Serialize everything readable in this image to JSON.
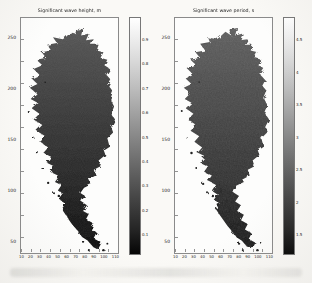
{
  "figure": {
    "kind": "scanned-journal-figure",
    "background": "#faf9f6",
    "panel_count": 2
  },
  "panels": [
    {
      "title": "Significant wave height, m",
      "y_ticks": [
        "250",
        "200",
        "150",
        "100",
        "50"
      ],
      "x_ticks": [
        "10",
        "20",
        "30",
        "40",
        "50",
        "60",
        "70",
        "80",
        "90",
        "100",
        "110"
      ],
      "colorbar": {
        "orientation": "vertical",
        "gradient_top": "#ffffff",
        "gradient_bottom": "#050505",
        "ticks": [
          "0.9",
          "0.8",
          "0.7",
          "0.6",
          "0.5",
          "0.4",
          "0.3",
          "0.2",
          "0.1"
        ]
      },
      "map_fill_top": "#565656",
      "map_fill_bottom": "#0d0d0d"
    },
    {
      "title": "Significant wave period, s",
      "y_ticks": [
        "250",
        "200",
        "150",
        "100",
        "50"
      ],
      "x_ticks": [
        "10",
        "20",
        "30",
        "40",
        "50",
        "60",
        "70",
        "80",
        "90",
        "100",
        "110"
      ],
      "colorbar": {
        "orientation": "vertical",
        "gradient_top": "#ffffff",
        "gradient_bottom": "#050505",
        "ticks": [
          "4.5",
          "4",
          "3.5",
          "3",
          "2.5",
          "2",
          "1.5"
        ]
      },
      "map_fill_top": "#5e5e5e",
      "map_fill_bottom": "#151515"
    }
  ],
  "chart_data": [
    {
      "type": "heatmap",
      "title": "Significant wave height, m",
      "xlabel": "",
      "ylabel": "",
      "x_ticks": [
        10,
        20,
        30,
        40,
        50,
        60,
        70,
        80,
        90,
        100,
        110
      ],
      "y_ticks": [
        50,
        100,
        150,
        200,
        250
      ],
      "xlim": [
        0,
        115
      ],
      "ylim": [
        0,
        260
      ],
      "colorbar_ticks": [
        0.1,
        0.2,
        0.3,
        0.4,
        0.5,
        0.6,
        0.7,
        0.8,
        0.9
      ],
      "colormap": "grayscale (light = high value at top of bar, dark = low)",
      "description": "Spatial field over a lake-shaped model grid; interior shading dark gray, darkest toward the narrow southern outlet and archipelago",
      "legend_position": "right-colorbar",
      "grid": false
    },
    {
      "type": "heatmap",
      "title": "Significant wave period, s",
      "xlabel": "",
      "ylabel": "",
      "x_ticks": [
        10,
        20,
        30,
        40,
        50,
        60,
        70,
        80,
        90,
        100,
        110
      ],
      "y_ticks": [
        50,
        100,
        150,
        200,
        250
      ],
      "xlim": [
        0,
        115
      ],
      "ylim": [
        0,
        260
      ],
      "colorbar_ticks": [
        1.5,
        2,
        2.5,
        3,
        3.5,
        4,
        4.5
      ],
      "colormap": "grayscale (light = high value at top of bar, dark = low)",
      "description": "Same lake-shaped model grid, slightly lighter interior shading with faint internal contours",
      "legend_position": "right-colorbar",
      "grid": false
    }
  ]
}
